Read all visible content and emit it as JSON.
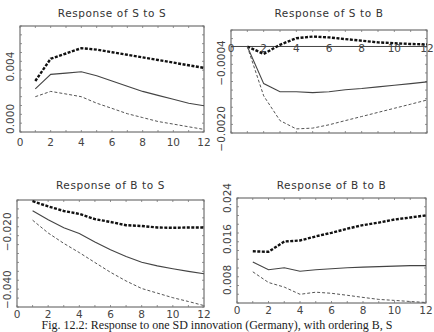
{
  "figure": {
    "caption": "Fig. 12.2:   Response to one SD innovation (Germany), with ordering B, S"
  },
  "chart_data": [
    {
      "type": "line",
      "title": "Response of S to S",
      "x": [
        1,
        2,
        3,
        4,
        5,
        6,
        7,
        8,
        9,
        10,
        11,
        12
      ],
      "xlim": [
        0,
        12
      ],
      "xticks": [
        0,
        2,
        4,
        6,
        8,
        10,
        12
      ],
      "ylim": [
        -0.001,
        0.0071
      ],
      "yticks": [
        0.0,
        0.004
      ],
      "ytick_labels": [
        "0.000",
        "0.004"
      ],
      "series": [
        {
          "name": "upper band",
          "style": "thick-dashed",
          "values": [
            0.0029,
            0.0046,
            0.005,
            0.0054,
            0.0053,
            0.0051,
            0.0049,
            0.0047,
            0.0045,
            0.0043,
            0.0041,
            0.0039
          ]
        },
        {
          "name": "impulse response",
          "style": "solid",
          "values": [
            0.0023,
            0.0034,
            0.0035,
            0.0036,
            0.0033,
            0.0029,
            0.0025,
            0.0021,
            0.0018,
            0.0015,
            0.0012,
            0.001
          ]
        },
        {
          "name": "lower band",
          "style": "thin-dashed",
          "values": [
            0.0017,
            0.0021,
            0.0019,
            0.0017,
            0.0012,
            0.0008,
            0.0004,
            0.0001,
            -0.0002,
            -0.0004,
            -0.0006,
            -0.0008
          ]
        }
      ],
      "grid": false
    },
    {
      "type": "line",
      "title": "Response of S to B",
      "x": [
        1,
        2,
        3,
        4,
        5,
        6,
        7,
        8,
        9,
        10,
        11,
        12
      ],
      "xlim": [
        0,
        12
      ],
      "xticks": [
        0,
        2,
        4,
        6,
        8,
        10,
        12
      ],
      "ylim": [
        -0.0021,
        0.0004
      ],
      "yticks": [
        0.0,
        -0.0004,
        -0.002
      ],
      "ytick_labels": [
        "-0.0004",
        "-0.0020"
      ],
      "zero_line": true,
      "series": [
        {
          "name": "upper band",
          "style": "thick-dashed",
          "values": [
            0.0,
            -0.00018,
            4e-05,
            0.0002,
            0.00024,
            0.00022,
            0.00018,
            0.00014,
            0.0001,
            8e-05,
            6e-05,
            5e-05
          ]
        },
        {
          "name": "impulse response",
          "style": "solid",
          "values": [
            0.0,
            -0.0009,
            -0.0011,
            -0.0011,
            -0.00112,
            -0.0011,
            -0.00105,
            -0.00102,
            -0.00098,
            -0.00094,
            -0.0009,
            -0.00086
          ]
        },
        {
          "name": "lower band",
          "style": "thin-dashed",
          "values": [
            0.0,
            -0.0012,
            -0.0018,
            -0.002,
            -0.00198,
            -0.0019,
            -0.0018,
            -0.0017,
            -0.0016,
            -0.0015,
            -0.0014,
            -0.0013
          ]
        }
      ],
      "grid": false
    },
    {
      "type": "line",
      "title": "Response of B to S",
      "x": [
        1,
        2,
        3,
        4,
        5,
        6,
        7,
        8,
        9,
        10,
        11,
        12
      ],
      "xlim": [
        0,
        12
      ],
      "xticks": [
        0,
        2,
        4,
        6,
        8,
        10,
        12
      ],
      "ylim": [
        -0.046,
        -0.009
      ],
      "yticks": [
        -0.02,
        -0.04
      ],
      "ytick_labels": [
        "-0.020",
        "-0.040"
      ],
      "series": [
        {
          "name": "upper band",
          "style": "thick-dashed",
          "values": [
            -0.0094,
            -0.0112,
            -0.0128,
            -0.0138,
            -0.0156,
            -0.0166,
            -0.0177,
            -0.018,
            -0.0185,
            -0.0186,
            -0.0185,
            -0.0185
          ]
        },
        {
          "name": "impulse response",
          "style": "solid",
          "values": [
            -0.0127,
            -0.0158,
            -0.0186,
            -0.0206,
            -0.0235,
            -0.0262,
            -0.0285,
            -0.0305,
            -0.0318,
            -0.0328,
            -0.0337,
            -0.0345
          ]
        },
        {
          "name": "lower band",
          "style": "thin-dashed",
          "values": [
            -0.016,
            -0.0204,
            -0.024,
            -0.0272,
            -0.0306,
            -0.034,
            -0.037,
            -0.0396,
            -0.0412,
            -0.0428,
            -0.0441,
            -0.0455
          ]
        }
      ],
      "grid": false
    },
    {
      "type": "line",
      "title": "Response of B to B",
      "x": [
        1,
        2,
        3,
        4,
        5,
        6,
        7,
        8,
        9,
        10,
        11,
        12
      ],
      "xlim": [
        0,
        12
      ],
      "xticks": [
        0,
        2,
        4,
        6,
        8,
        10,
        12
      ],
      "ylim": [
        0.0035,
        0.024
      ],
      "yticks": [
        0.008,
        0.016,
        0.024
      ],
      "ytick_labels": [
        "0.008",
        "0.016",
        "0.024"
      ],
      "series": [
        {
          "name": "upper band",
          "style": "thick-dashed",
          "values": [
            0.0136,
            0.0135,
            0.0155,
            0.0157,
            0.0165,
            0.0172,
            0.018,
            0.0187,
            0.0192,
            0.0198,
            0.0202,
            0.0206
          ]
        },
        {
          "name": "impulse response",
          "style": "solid",
          "values": [
            0.0115,
            0.01,
            0.0104,
            0.0097,
            0.01,
            0.0102,
            0.0104,
            0.0105,
            0.0106,
            0.0107,
            0.0108,
            0.0108
          ]
        },
        {
          "name": "lower band",
          "style": "thin-dashed",
          "values": [
            0.0096,
            0.0075,
            0.0066,
            0.0052,
            0.0056,
            0.0054,
            0.005,
            0.0046,
            0.0042,
            0.004,
            0.0038,
            0.0036
          ]
        }
      ],
      "grid": false
    }
  ]
}
